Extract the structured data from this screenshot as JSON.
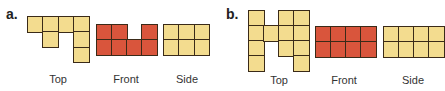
{
  "colors": {
    "yellow": "#f3dc8f",
    "red": "#d9553c",
    "border": "#3a2a18"
  },
  "parts": [
    {
      "label": "a.",
      "label_pos": [
        6,
        6
      ],
      "views": [
        {
          "caption": "Top",
          "x": 27,
          "y": 16,
          "cell": 15.3,
          "color": "yellow",
          "cells": [
            [
              0,
              0
            ],
            [
              0,
              1
            ],
            [
              0,
              2
            ],
            [
              0,
              3
            ],
            [
              1,
              1
            ],
            [
              1,
              3
            ],
            [
              2,
              3
            ]
          ],
          "caption_pos": [
            28,
            73
          ]
        },
        {
          "caption": "Front",
          "x": 96,
          "y": 24,
          "cell": 15,
          "color": "red",
          "cells": [
            [
              0,
              0
            ],
            [
              0,
              1
            ],
            [
              0,
              3
            ],
            [
              1,
              0
            ],
            [
              1,
              1
            ],
            [
              1,
              2
            ],
            [
              1,
              3
            ]
          ],
          "caption_pos": [
            96,
            73
          ]
        },
        {
          "caption": "Side",
          "x": 163,
          "y": 24,
          "cell": 15.3,
          "color": "yellow",
          "cells": [
            [
              0,
              0
            ],
            [
              0,
              1
            ],
            [
              0,
              2
            ],
            [
              1,
              0
            ],
            [
              1,
              1
            ],
            [
              1,
              2
            ]
          ],
          "caption_pos": [
            157,
            73
          ]
        }
      ]
    },
    {
      "label": "b.",
      "label_pos": [
        226,
        6
      ],
      "views": [
        {
          "caption": "Top",
          "x": 248,
          "y": 10,
          "cell": 15,
          "color": "yellow",
          "cells": [
            [
              0,
              0
            ],
            [
              1,
              0
            ],
            [
              2,
              0
            ],
            [
              3,
              0
            ],
            [
              1,
              1
            ],
            [
              0,
              2
            ],
            [
              1,
              2
            ],
            [
              2,
              2
            ],
            [
              0,
              3
            ],
            [
              1,
              3
            ],
            [
              2,
              3
            ],
            [
              3,
              3
            ]
          ],
          "caption_pos": [
            249,
            74
          ]
        },
        {
          "caption": "Front",
          "x": 315,
          "y": 26,
          "cell": 15,
          "color": "red",
          "cells": [
            [
              0,
              0
            ],
            [
              0,
              1
            ],
            [
              0,
              2
            ],
            [
              0,
              3
            ],
            [
              1,
              0
            ],
            [
              1,
              1
            ],
            [
              1,
              2
            ],
            [
              1,
              3
            ]
          ],
          "caption_pos": [
            314,
            74
          ]
        },
        {
          "caption": "Side",
          "x": 383,
          "y": 26,
          "cell": 15,
          "color": "yellow",
          "cells": [
            [
              0,
              0
            ],
            [
              0,
              1
            ],
            [
              0,
              2
            ],
            [
              0,
              3
            ],
            [
              1,
              0
            ],
            [
              1,
              1
            ],
            [
              1,
              2
            ],
            [
              1,
              3
            ]
          ],
          "caption_pos": [
            383,
            74
          ]
        }
      ]
    }
  ]
}
